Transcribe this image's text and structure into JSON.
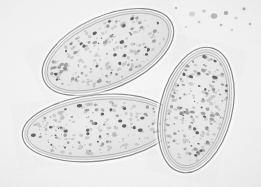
{
  "image": {
    "kind": "light-microscopy-photomicrograph",
    "subject": "parasite-eggs",
    "object_count": 3,
    "width_px": 261,
    "height_px": 187,
    "background_color": "#f2f2f2",
    "shell_color": "#6f6f6f",
    "interior_color": "#e8e8e8",
    "granule_color": "#5a5a5a",
    "debris_color": "#8c8c8c",
    "alt_text": "Three oval parasite eggs with thick double-layered shells and granular interiors on a pale gray background"
  },
  "eggs": [
    {
      "id": "egg-top-left",
      "label": "Egg 1 (upper left)",
      "cx": 108,
      "cy": 52,
      "rx": 70,
      "ry": 36,
      "rotation_deg": -24,
      "shell_layers": 3,
      "granule_count": 240
    },
    {
      "id": "egg-bottom-left",
      "label": "Egg 2 (lower left)",
      "cx": 98,
      "cy": 128,
      "rx": 76,
      "ry": 33,
      "rotation_deg": -6,
      "shell_layers": 3,
      "granule_count": 230
    },
    {
      "id": "egg-right",
      "label": "Egg 3 (right)",
      "cx": 196,
      "cy": 110,
      "rx": 36,
      "ry": 64,
      "rotation_deg": 14,
      "shell_layers": 4,
      "granule_count": 250
    }
  ],
  "debris": [
    {
      "cx": 192,
      "cy": 14,
      "r": 2.6
    },
    {
      "cx": 204,
      "cy": 11,
      "r": 1.6
    },
    {
      "cx": 214,
      "cy": 16,
      "r": 2.8
    },
    {
      "cx": 226,
      "cy": 13,
      "r": 2.0
    },
    {
      "cx": 236,
      "cy": 18,
      "r": 1.5
    },
    {
      "cx": 199,
      "cy": 22,
      "r": 1.3
    },
    {
      "cx": 221,
      "cy": 25,
      "r": 1.2
    },
    {
      "cx": 244,
      "cy": 9,
      "r": 1.4
    },
    {
      "cx": 186,
      "cy": 27,
      "r": 1.1
    },
    {
      "cx": 232,
      "cy": 30,
      "r": 1.0
    },
    {
      "cx": 250,
      "cy": 24,
      "r": 1.2
    },
    {
      "cx": 176,
      "cy": 8,
      "r": 1.0
    }
  ]
}
